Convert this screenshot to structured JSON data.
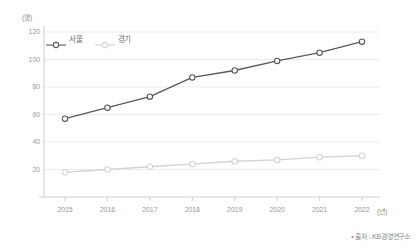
{
  "chart_data": {
    "type": "line",
    "title": "",
    "xlabel": "(년)",
    "ylabel": "(명)",
    "unit_y": "(명)",
    "unit_x": "(년)",
    "categories": [
      "2015",
      "2016",
      "2017",
      "2018",
      "2019",
      "2020",
      "2021",
      "2022"
    ],
    "ylim": [
      0,
      120
    ],
    "yticks": [
      120,
      100,
      80,
      60,
      40,
      20
    ],
    "grid": true,
    "legend_position": "top-left",
    "series": [
      {
        "name": "서울",
        "color": "#595959",
        "values": [
          57,
          65,
          73,
          87,
          92,
          99,
          105,
          113
        ]
      },
      {
        "name": "경기",
        "color": "#d4d4d4",
        "values": [
          18,
          20,
          22,
          24,
          26,
          27,
          29,
          30
        ]
      }
    ],
    "source": "• 출처 : KB경영연구소"
  },
  "legend": {
    "items": [
      {
        "label": "서울"
      },
      {
        "label": "경기"
      }
    ]
  },
  "colors": {
    "seoul": "#595959",
    "gyeonggi": "#d4d4d4",
    "axis": "#c8c8c8",
    "grid": "#e2e2e2",
    "marker_fill": "#ffffff",
    "background": "#ffffff"
  }
}
